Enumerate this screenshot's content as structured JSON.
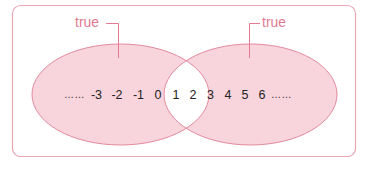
{
  "diagram": {
    "type": "venn",
    "colors": {
      "frame": "#E9A6B4",
      "fill": "#F8D4DC",
      "stroke": "#E28A9E",
      "label": "#E47A92",
      "intersection": "#FFFFFF",
      "numbers": "#222222"
    },
    "left_set": {
      "label": "true"
    },
    "right_set": {
      "label": "true"
    },
    "number_line": {
      "leading_ellipsis": "……",
      "trailing_ellipsis": "……",
      "left_only": [
        "-3",
        "-2",
        "-1",
        "0"
      ],
      "intersection": [
        "1",
        "2"
      ],
      "right_only": [
        "3",
        "4",
        "5",
        "6"
      ]
    }
  }
}
